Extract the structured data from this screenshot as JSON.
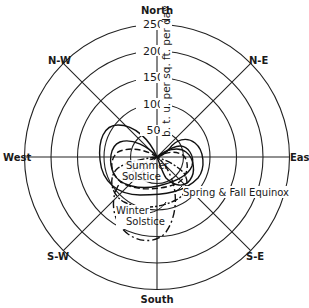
{
  "diagram": {
    "type": "polar-diagram",
    "directions": {
      "north": "North",
      "south": "South",
      "east": "East",
      "west": "West",
      "ne": "N-E",
      "nw": "N-W",
      "se": "S-E",
      "sw": "S-W"
    },
    "radial_axis": {
      "unit_label": "b. t. u. per sq. ft. per day",
      "ticks": [
        "500",
        "1000",
        "1500",
        "2000",
        "2500"
      ]
    },
    "curves": {
      "summer": "Summer Solstice",
      "summer_line1": "Summer",
      "summer_line2": "Solstice",
      "winter_line1": "Winter",
      "winter_line2": "Solstice",
      "equinox": "Spring & Fall Equinox"
    }
  }
}
